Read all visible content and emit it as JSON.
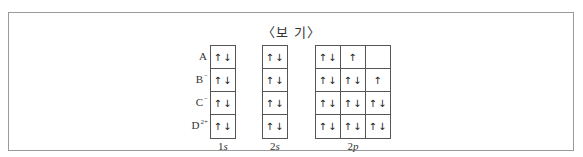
{
  "title": "〈보 기〉",
  "rows": [
    {
      "base": "A",
      "charge": ""
    },
    {
      "base": "B",
      "charge": "−"
    },
    {
      "base": "C",
      "charge": "−"
    },
    {
      "base": "D",
      "charge": "2+"
    }
  ],
  "columns": [
    {
      "label_num": "1",
      "label_letter": "s"
    },
    {
      "label_num": "2",
      "label_letter": "s"
    },
    {
      "label_num": "2",
      "label_letter": "p"
    }
  ],
  "orbitals": {
    "1s": [
      "↑↓",
      "↑↓",
      "↑↓",
      "↑↓"
    ],
    "2s": [
      "↑↓",
      "↑↓",
      "↑↓",
      "↑↓"
    ],
    "2p": [
      [
        "↑↓",
        "↑",
        ""
      ],
      [
        "↑↓",
        "↑↓",
        "↑"
      ],
      [
        "↑↓",
        "↑↓",
        "↑↓"
      ],
      [
        "↑↓",
        "↑↓",
        "↑↓"
      ]
    ]
  }
}
